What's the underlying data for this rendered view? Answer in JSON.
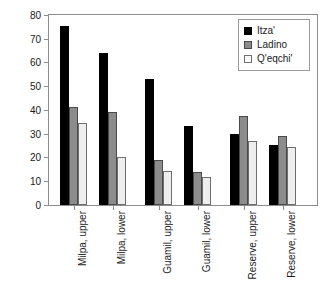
{
  "chart_data": {
    "type": "bar",
    "title": "",
    "subtitle": "",
    "xlabel": "",
    "ylabel": "",
    "ylim": [
      0,
      80
    ],
    "yticks": [
      0,
      10,
      20,
      30,
      40,
      50,
      60,
      70,
      80
    ],
    "ytick_labels": [
      "0",
      "10",
      "20",
      "30",
      "40",
      "50",
      "60",
      "70",
      "80"
    ],
    "grid": false,
    "legend_position": "top-right",
    "categories": [
      "Milpa, upper",
      "Milpa, lower",
      "Guamil, upper",
      "Guamil, lower",
      "Reserve, upper",
      "Reserve, lower"
    ],
    "series": [
      {
        "name": "Itza'",
        "color": "#000000",
        "values": [
          75.4,
          64.0,
          53.2,
          33.3,
          30.1,
          25.1
        ]
      },
      {
        "name": "Ladino",
        "color": "#8c8c8c",
        "values": [
          41.3,
          39.0,
          19.1,
          14.0,
          37.5,
          29.1
        ]
      },
      {
        "name": "Q'eqchi'",
        "color": "#eeeeee",
        "values": [
          34.5,
          20.1,
          14.4,
          11.8,
          26.9,
          24.5
        ]
      }
    ]
  },
  "legend": {
    "items": [
      {
        "label": "Itza'"
      },
      {
        "label": "Ladino"
      },
      {
        "label": "Q'eqchi'"
      }
    ]
  }
}
